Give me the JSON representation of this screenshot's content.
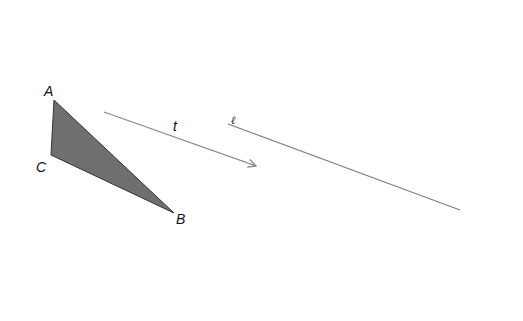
{
  "diagram": {
    "colors": {
      "background": "#ffffff",
      "triangle_fill": "#6f6f6f",
      "triangle_stroke": "#333333",
      "line": "#808080",
      "vector": "#8a8a8a",
      "text": "#111111"
    },
    "triangle": {
      "vertices": [
        {
          "name": "A",
          "x": 54,
          "y": 100,
          "label_x": 44,
          "label_y": 96
        },
        {
          "name": "B",
          "x": 174,
          "y": 213,
          "label_x": 176,
          "label_y": 224
        },
        {
          "name": "C",
          "x": 51,
          "y": 155,
          "label_x": 36,
          "label_y": 172
        }
      ]
    },
    "vector": {
      "label": "t",
      "x1": 104,
      "y1": 112,
      "x2": 256,
      "y2": 166,
      "label_x": 173,
      "label_y": 131
    },
    "line": {
      "label": "ℓ",
      "x1": 228,
      "y1": 124,
      "x2": 460,
      "y2": 210,
      "label_x": 231,
      "label_y": 124
    }
  }
}
